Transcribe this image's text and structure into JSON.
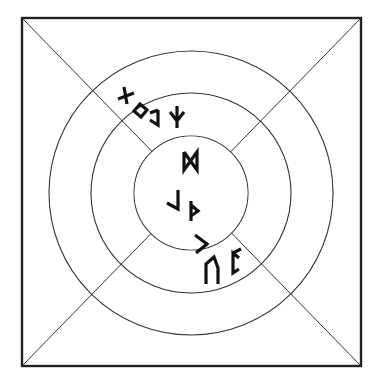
{
  "diagram": {
    "frame": {
      "x": 22,
      "y": 18,
      "width": 339,
      "height": 348
    },
    "center": {
      "x": 191,
      "y": 193
    },
    "rings": [
      {
        "radius": 57
      },
      {
        "radius": 100
      },
      {
        "radius": 142
      }
    ],
    "diagonals": [
      {
        "name": "top-left-to-bottom-right"
      },
      {
        "name": "top-right-to-bottom-left"
      }
    ],
    "stroke_color": "#222222",
    "background_color": "#ffffff",
    "rune_groups": [
      {
        "name": "outer-top-left",
        "runes": [
          "gebo-like",
          "ing-like",
          "eh-like",
          "algiz"
        ]
      },
      {
        "name": "inner-top",
        "runes": [
          "dagaz"
        ]
      },
      {
        "name": "inner-center",
        "runes": [
          "laguz-mirror",
          "thurisaz"
        ]
      },
      {
        "name": "inner-bottom",
        "runes": [
          "kaunan"
        ]
      },
      {
        "name": "middle-bottom-right",
        "runes": [
          "uruz",
          "perthro"
        ]
      }
    ]
  }
}
